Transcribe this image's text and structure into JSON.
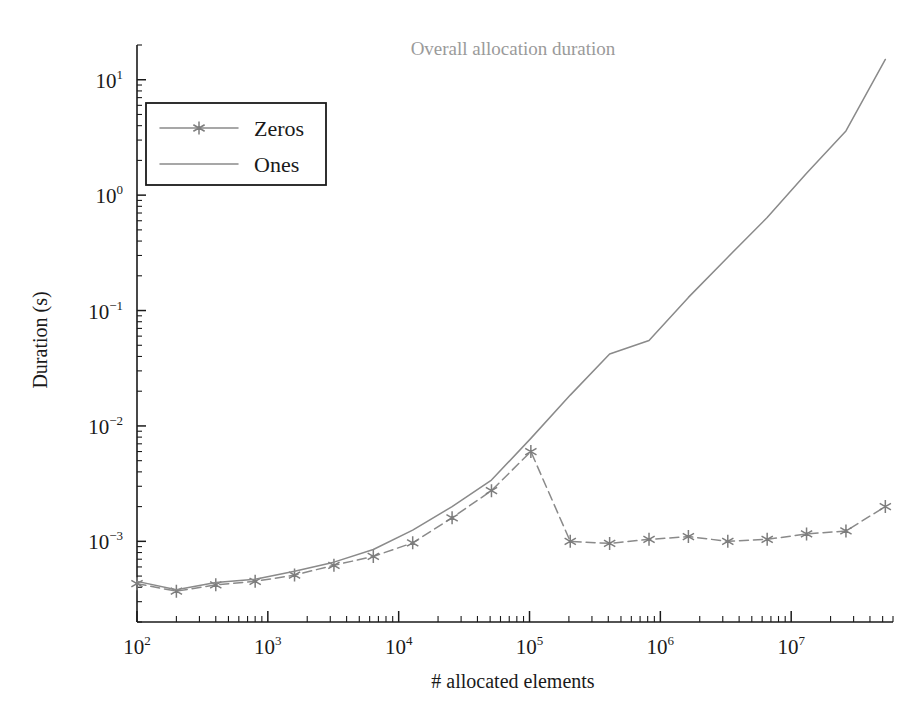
{
  "chart_data": {
    "type": "line",
    "title": "Overall allocation duration",
    "xlabel": "# allocated elements",
    "ylabel": "Duration (s)",
    "xscale": "log",
    "yscale": "log",
    "xlim": [
      100,
      60000000
    ],
    "ylim": [
      0.0002,
      20
    ],
    "grid": false,
    "legend_position": "upper left",
    "xticks": [
      100,
      1000,
      10000,
      100000,
      1000000,
      10000000
    ],
    "xtick_labels": [
      "10^2",
      "10^3",
      "10^4",
      "10^5",
      "10^6",
      "10^7"
    ],
    "yticks": [
      0.001,
      0.01,
      0.1,
      1,
      10
    ],
    "ytick_labels": [
      "10^-3",
      "10^-2",
      "10^-1",
      "10^0",
      "10^1"
    ],
    "series": [
      {
        "name": "Zeros",
        "marker": "star",
        "linestyle": "dashed",
        "color": "#8a8a8a",
        "x": [
          100,
          200,
          400,
          800,
          1600,
          3200,
          6400,
          12800,
          25600,
          51200,
          102400,
          204800,
          409600,
          819200,
          1638400,
          3276800,
          6553600,
          13107200,
          26214400,
          52428800
        ],
        "y": [
          0.00043,
          0.00037,
          0.00042,
          0.00045,
          0.00051,
          0.00062,
          0.00074,
          0.00097,
          0.0016,
          0.00275,
          0.006,
          0.001,
          0.00096,
          0.00104,
          0.0011,
          0.001,
          0.00104,
          0.00116,
          0.00123,
          0.002
        ]
      },
      {
        "name": "Ones",
        "marker": "none",
        "linestyle": "solid",
        "color": "#8a8a8a",
        "x": [
          100,
          200,
          400,
          800,
          1600,
          3200,
          6400,
          12800,
          25600,
          51200,
          102400,
          204800,
          409600,
          819200,
          1638400,
          3276800,
          6553600,
          13107200,
          26214400,
          52428800
        ],
        "y": [
          0.00045,
          0.00038,
          0.00044,
          0.00047,
          0.00055,
          0.00066,
          0.00085,
          0.00125,
          0.002,
          0.0034,
          0.0078,
          0.0185,
          0.042,
          0.055,
          0.13,
          0.29,
          0.64,
          1.55,
          3.6,
          15.0
        ]
      }
    ]
  },
  "legend": {
    "entries": [
      {
        "label": "Zeros"
      },
      {
        "label": "Ones"
      }
    ]
  }
}
